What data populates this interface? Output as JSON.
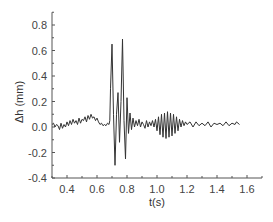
{
  "chart_data": {
    "type": "line",
    "title": "",
    "xlabel": "t(s)",
    "ylabel": "Δh (mm)",
    "xlim": [
      0.3,
      1.7
    ],
    "ylim": [
      -0.4,
      0.9
    ],
    "xticks": [
      0.4,
      0.6,
      0.8,
      1.0,
      1.2,
      1.4,
      1.6
    ],
    "xtick_labels": [
      "0.4",
      "0.6",
      "0.8",
      "1.0",
      "1.2",
      "1.4",
      "1.6"
    ],
    "yticks": [
      0.8,
      0.6,
      0.4,
      0.2,
      0.0,
      -0.2,
      -0.4
    ],
    "ytick_labels": [
      "0.8",
      "0.6",
      "0.4",
      "0.2",
      "0.0",
      "-0.2",
      "-0.4"
    ],
    "grid": false,
    "legend": null,
    "line_color": "#333333",
    "series": [
      {
        "name": "Δh",
        "x": [
          0.3,
          0.31,
          0.32,
          0.33,
          0.34,
          0.35,
          0.36,
          0.37,
          0.38,
          0.39,
          0.4,
          0.41,
          0.42,
          0.43,
          0.44,
          0.45,
          0.46,
          0.47,
          0.48,
          0.49,
          0.5,
          0.51,
          0.52,
          0.53,
          0.54,
          0.55,
          0.56,
          0.57,
          0.58,
          0.59,
          0.6,
          0.61,
          0.62,
          0.63,
          0.64,
          0.65,
          0.66,
          0.67,
          0.68,
          0.685,
          0.69,
          0.7,
          0.71,
          0.72,
          0.73,
          0.74,
          0.75,
          0.76,
          0.77,
          0.78,
          0.79,
          0.8,
          0.81,
          0.82,
          0.83,
          0.84,
          0.85,
          0.86,
          0.87,
          0.88,
          0.89,
          0.9,
          0.91,
          0.92,
          0.93,
          0.94,
          0.95,
          0.96,
          0.97,
          0.98,
          0.99,
          1.0,
          1.01,
          1.02,
          1.03,
          1.04,
          1.05,
          1.06,
          1.07,
          1.08,
          1.09,
          1.1,
          1.11,
          1.12,
          1.13,
          1.14,
          1.15,
          1.16,
          1.17,
          1.18,
          1.19,
          1.2,
          1.22,
          1.24,
          1.26,
          1.28,
          1.3,
          1.32,
          1.34,
          1.36,
          1.38,
          1.4,
          1.42,
          1.44,
          1.46,
          1.48,
          1.5,
          1.52,
          1.53,
          1.54,
          1.55
        ],
        "y": [
          0.02,
          0.03,
          0.0,
          0.02,
          0.01,
          -0.02,
          0.03,
          -0.01,
          0.02,
          0.0,
          0.04,
          0.01,
          0.05,
          0.02,
          0.06,
          0.03,
          0.05,
          0.02,
          0.07,
          0.03,
          0.06,
          0.05,
          0.08,
          0.04,
          0.09,
          0.06,
          0.1,
          0.07,
          0.08,
          0.05,
          0.07,
          0.04,
          0.02,
          0.03,
          0.01,
          0.02,
          0.01,
          0.03,
          0.02,
          0.05,
          0.3,
          0.65,
          0.1,
          -0.3,
          0.1,
          0.27,
          -0.12,
          0.2,
          0.69,
          0.05,
          -0.25,
          0.23,
          -0.05,
          0.11,
          -0.02,
          0.07,
          0.0,
          0.05,
          0.01,
          0.06,
          0.0,
          0.04,
          0.02,
          -0.01,
          0.05,
          0.0,
          0.04,
          0.01,
          0.05,
          0.0,
          0.06,
          -0.03,
          0.08,
          -0.06,
          0.1,
          -0.08,
          0.11,
          -0.09,
          0.12,
          -0.08,
          0.11,
          -0.07,
          0.1,
          -0.05,
          0.08,
          -0.03,
          0.06,
          0.0,
          0.05,
          0.01,
          0.04,
          0.02,
          0.04,
          0.0,
          0.04,
          0.01,
          0.03,
          0.01,
          0.04,
          0.0,
          0.03,
          0.02,
          0.03,
          0.01,
          0.04,
          0.01,
          0.03,
          0.02,
          0.04,
          0.03,
          0.02
        ]
      }
    ]
  }
}
